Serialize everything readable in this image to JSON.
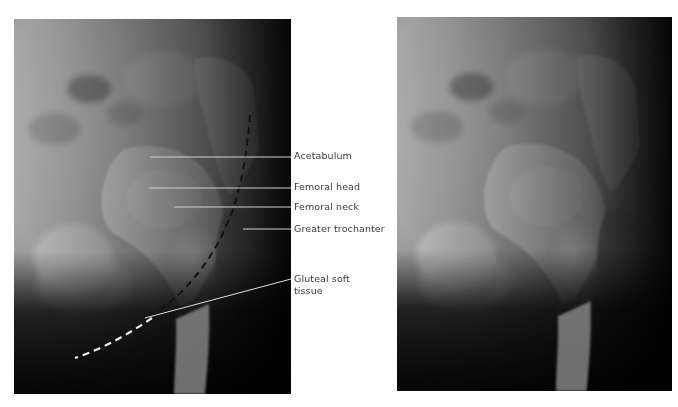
{
  "figure": {
    "left_panel": {
      "description": "Annotated radiograph of hip (lateral oblique view) with labels and dashed line marking gluteal soft tissue border",
      "labels": [
        {
          "text": "Acetabulum",
          "y": 150
        },
        {
          "text": "Femoral head",
          "y": 181
        },
        {
          "text": "Femoral neck",
          "y": 201
        },
        {
          "text": "Greater trochanter",
          "y": 223
        },
        {
          "text": "Gluteal soft",
          "y": 273
        },
        {
          "text": "tissue",
          "y": 285
        }
      ],
      "leader_lines": [
        {
          "name": "acetabulum",
          "x1": 150,
          "y1": 157,
          "x2": 291,
          "y2": 157
        },
        {
          "name": "femoral-head",
          "x1": 149,
          "y1": 188,
          "x2": 291,
          "y2": 188
        },
        {
          "name": "femoral-neck",
          "x1": 174,
          "y1": 207,
          "x2": 291,
          "y2": 207
        },
        {
          "name": "greater-trochanter",
          "x1": 243,
          "y1": 229,
          "x2": 291,
          "y2": 229
        },
        {
          "name": "gluteal-soft-tissue",
          "x1": 145,
          "y1": 318,
          "x2": 291,
          "y2": 279
        }
      ],
      "dashed_curve": "M250,115 C247,150 243,180 232,212 C220,245 200,275 175,298 C145,322 110,345 75,358"
    },
    "right_panel": {
      "description": "Unannotated radiograph of the same hip view"
    },
    "colors": {
      "label_text": "#3a3a3a",
      "leader_line": "#d8d8d8",
      "background": "#ffffff"
    }
  }
}
